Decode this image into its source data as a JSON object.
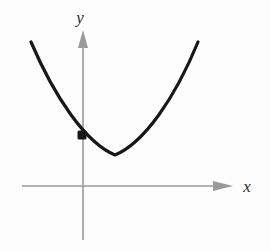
{
  "figure": {
    "kind": "parabola-graph",
    "background_color": "#fdfdfd"
  },
  "axes": {
    "x_axis": {
      "label": "x",
      "label_position": {
        "x": 247,
        "y": 192
      },
      "line_color": "#9a9a9a",
      "start": {
        "x": 22,
        "y": 186
      },
      "end": {
        "x": 233,
        "y": 186
      },
      "arrow": "right",
      "arrow_tip": {
        "x": 233,
        "y": 186
      }
    },
    "y_axis": {
      "label": "y",
      "label_position": {
        "x": 80,
        "y": 23
      },
      "line_color": "#9a9a9a",
      "start": {
        "x": 83,
        "y": 240
      },
      "end": {
        "x": 83,
        "y": 30
      },
      "arrow": "up",
      "arrow_tip": {
        "x": 83,
        "y": 30
      }
    },
    "origin": {
      "x": 83,
      "y": 186
    }
  },
  "chart_data": {
    "type": "line",
    "title": "",
    "xlabel": "x",
    "ylabel": "y",
    "curve": {
      "name": "parabola",
      "shape": "upward-opening parabola",
      "color": "#171717",
      "stroke_width": 3.2,
      "vertex": {
        "x": 115,
        "y": 155
      },
      "left_endpoint": {
        "x": 31,
        "y": 42
      },
      "right_endpoint": {
        "x": 198,
        "y": 42
      },
      "path": "M 31 42 C 55 98, 86 143, 115 155 C 144 143, 175 98, 198 42"
    },
    "points": [
      {
        "name": "marked-point",
        "x": 82,
        "y": 135,
        "style": "filled-square-dot",
        "color": "#171717",
        "size": 9,
        "note": "y-intercept of the parabola"
      }
    ],
    "grid": false,
    "legend": false
  }
}
